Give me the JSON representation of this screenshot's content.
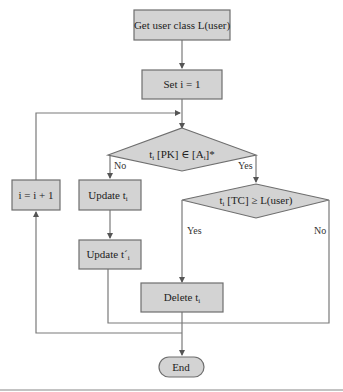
{
  "diagram": {
    "type": "flowchart",
    "nodes": {
      "start": {
        "label": "Get user class L(user)",
        "shape": "rect"
      },
      "init": {
        "label": "Set i = 1",
        "shape": "rect"
      },
      "cond1": {
        "label_main": "t",
        "label_sub": "i",
        "label_rest1": " [PK] ∈ [A",
        "label_sub2": "i",
        "label_rest2": "]*",
        "shape": "diamond"
      },
      "cond2": {
        "label_main": "t",
        "label_sub": "i",
        "label_rest": " [TC] ≥ L(user)",
        "shape": "diamond"
      },
      "update1": {
        "label_main": "Update t",
        "label_sub": "i",
        "shape": "rect"
      },
      "update2": {
        "label_main": "Update t´",
        "label_sub": "i",
        "shape": "rect"
      },
      "delete": {
        "label_main": "Delete t",
        "label_sub": "i",
        "shape": "rect"
      },
      "increment": {
        "label": "i = i + 1",
        "shape": "rect"
      },
      "end": {
        "label": "End",
        "shape": "rounded"
      }
    },
    "edge_labels": {
      "cond1_no": "No",
      "cond1_yes": "Yes",
      "cond2_yes": "Yes",
      "cond2_no": "No"
    },
    "colors": {
      "node_fill": "#d3d3d3",
      "node_stroke": "#6e6e6e",
      "edge": "#7a7a7a"
    }
  }
}
